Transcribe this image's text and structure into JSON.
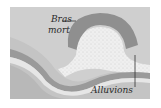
{
  "diagram": {
    "labels": {
      "oxbow": "Bras",
      "oxbow_line2": "mort",
      "alluvium": "Alluvions"
    },
    "colors": {
      "background": "#cfcfcf",
      "oxbow_water": "#8f8f8f",
      "river_dark": "#9a9a9a",
      "river_light": "#e6e6e6",
      "alluvium": "#efefef",
      "leader_line": "#333333"
    }
  }
}
